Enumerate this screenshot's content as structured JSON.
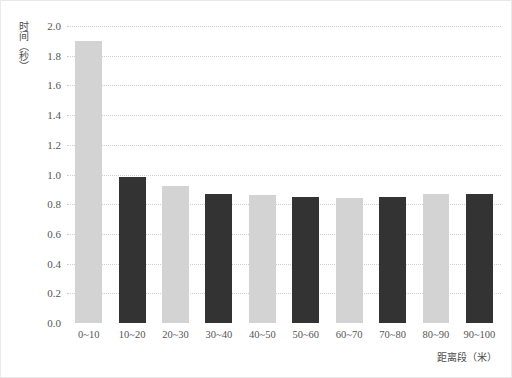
{
  "chart_data": {
    "type": "bar",
    "title": "",
    "xlabel": "距离段（米）",
    "ylabel": "时间（秒）",
    "categories": [
      "0~10",
      "10~20",
      "20~30",
      "30~40",
      "40~50",
      "50~60",
      "60~70",
      "70~80",
      "80~90",
      "90~100"
    ],
    "values": [
      1.9,
      0.98,
      0.92,
      0.87,
      0.86,
      0.85,
      0.84,
      0.85,
      0.87,
      0.87
    ],
    "bar_colors": [
      "#d3d3d3",
      "#333333",
      "#d3d3d3",
      "#333333",
      "#d3d3d3",
      "#333333",
      "#d3d3d3",
      "#333333",
      "#d3d3d3",
      "#333333"
    ],
    "ylim": [
      0.0,
      2.0
    ],
    "ytick_values": [
      0.0,
      0.2,
      0.4,
      0.6,
      0.8,
      1.0,
      1.2,
      1.4,
      1.6,
      1.8,
      2.0
    ],
    "ytick_labels": [
      "0.0",
      "0.2",
      "0.4",
      "0.6",
      "0.8",
      "1.0",
      "1.2",
      "1.4",
      "1.6",
      "1.8",
      "2.0"
    ],
    "grid": true,
    "grid_style": "dotted",
    "grid_color": "#cfcfcf",
    "legend": null,
    "legend_position": "none",
    "background_color": "#ffffff",
    "border_color": "#e9e9e9"
  }
}
